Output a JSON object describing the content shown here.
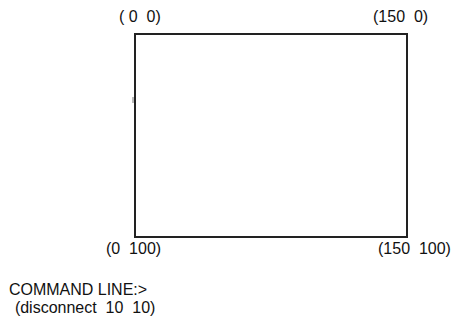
{
  "canvas": {
    "corners": {
      "top_left": "( 0  0)",
      "top_right": "(150  0)",
      "bottom_left": "(0  100)",
      "bottom_right": "(150  100)"
    }
  },
  "command_line": {
    "prompt": "COMMAND LINE:>",
    "command": "(disconnect  10  10)"
  }
}
